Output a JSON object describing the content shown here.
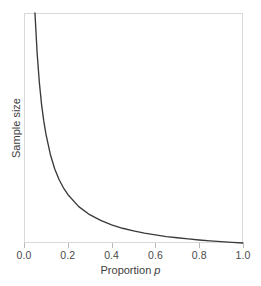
{
  "chart_data": {
    "type": "line",
    "title": "",
    "subtitle": "",
    "xlabel_text": "Proportion",
    "xlabel_italic": "p",
    "ylabel": "Sample size",
    "xlim": [
      0.0,
      1.0
    ],
    "ylim": [
      0,
      100
    ],
    "grid": false,
    "legend": null,
    "legend_position": "none",
    "x_ticks": [
      "0.0",
      "0.2",
      "0.4",
      "0.6",
      "0.8",
      "1.0"
    ],
    "x_tick_values": [
      0.0,
      0.2,
      0.4,
      0.6,
      0.8,
      1.0
    ],
    "y_ticks": [],
    "y_tick_values": [],
    "series": [
      {
        "name": "Required sample size",
        "relationship": "n proportional to (1 - p) / p",
        "x": [
          0.05,
          0.06,
          0.07,
          0.08,
          0.09,
          0.1,
          0.12,
          0.14,
          0.16,
          0.18,
          0.2,
          0.25,
          0.3,
          0.35,
          0.4,
          0.45,
          0.5,
          0.55,
          0.6,
          0.65,
          0.7,
          0.75,
          0.8,
          0.85,
          0.9,
          0.95,
          1.0
        ],
        "y": [
          100.0,
          82.5,
          69.9,
          60.4,
          53.2,
          47.4,
          38.6,
          32.3,
          27.6,
          24.0,
          21.1,
          15.8,
          12.3,
          9.8,
          7.9,
          6.4,
          5.3,
          4.3,
          3.5,
          2.8,
          2.3,
          1.8,
          1.3,
          0.9,
          0.6,
          0.3,
          0.0
        ]
      }
    ],
    "colors": {
      "curve": "#3a3a3a",
      "frame": "#d9d9d9",
      "tick": "#b9b9b9",
      "text": "#3d3d3d",
      "tick_text": "#4a4a4a",
      "background": "#ffffff"
    }
  },
  "axes": {
    "x_ticks": [
      {
        "label": "0.0",
        "value": 0.0
      },
      {
        "label": "0.2",
        "value": 0.2
      },
      {
        "label": "0.4",
        "value": 0.4
      },
      {
        "label": "0.6",
        "value": 0.6
      },
      {
        "label": "0.8",
        "value": 0.8
      },
      {
        "label": "1.0",
        "value": 1.0
      }
    ]
  }
}
